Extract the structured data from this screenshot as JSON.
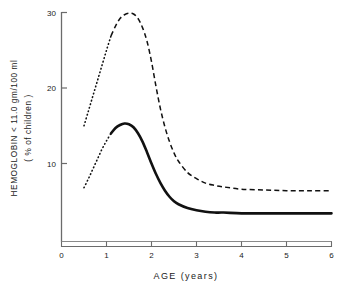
{
  "chart_data": {
    "type": "line",
    "title": "",
    "xlabel": "AGE  (years)",
    "ylabel_line1": "HEMOGLOBIN  < 11.0 gm/100 ml",
    "ylabel_line2": "( % of children )",
    "xlim": [
      0,
      6
    ],
    "ylim": [
      0,
      30
    ],
    "xticks": [
      0,
      1,
      2,
      3,
      4,
      5,
      6
    ],
    "xticklabels": [
      "0",
      "1",
      "2",
      "3",
      "4",
      "5",
      "6"
    ],
    "yticks": [
      10,
      20,
      30
    ],
    "yticklabels": [
      "10",
      "20",
      "30"
    ],
    "grid": false,
    "legend": "none",
    "series": [
      {
        "name": "upper-curve",
        "style": "dashed",
        "lead_in_style": "dotted",
        "x": [
          0.5,
          0.6,
          0.7,
          0.8,
          0.9,
          1.0,
          1.1,
          1.2,
          1.3,
          1.4,
          1.5,
          1.6,
          1.7,
          1.8,
          1.9,
          2.0,
          2.1,
          2.2,
          2.3,
          2.4,
          2.5,
          2.6,
          2.8,
          3.0,
          3.2,
          3.4,
          3.6,
          4.0,
          4.5,
          5.0,
          5.5,
          6.0
        ],
        "y": [
          15.0,
          17.0,
          19.0,
          21.0,
          23.0,
          25.0,
          26.9,
          28.2,
          29.2,
          29.7,
          29.9,
          29.8,
          29.2,
          28.0,
          26.2,
          23.5,
          20.2,
          17.2,
          14.8,
          12.9,
          11.4,
          10.3,
          8.8,
          8.0,
          7.4,
          7.1,
          6.9,
          6.6,
          6.5,
          6.4,
          6.4,
          6.4
        ],
        "lead_in_end_x": 1.1
      },
      {
        "name": "lower-curve",
        "style": "solid",
        "lead_in_style": "dotted",
        "x": [
          0.5,
          0.6,
          0.7,
          0.8,
          0.9,
          1.0,
          1.1,
          1.2,
          1.3,
          1.4,
          1.5,
          1.6,
          1.7,
          1.8,
          1.9,
          2.0,
          2.1,
          2.2,
          2.3,
          2.4,
          2.5,
          2.6,
          2.8,
          3.0,
          3.2,
          3.4,
          3.6,
          4.0,
          4.5,
          5.0,
          5.5,
          6.0
        ],
        "y": [
          6.8,
          8.0,
          9.3,
          10.6,
          11.9,
          13.0,
          14.0,
          14.7,
          15.1,
          15.3,
          15.2,
          14.8,
          14.0,
          12.9,
          11.5,
          10.0,
          8.6,
          7.4,
          6.4,
          5.6,
          5.0,
          4.6,
          4.1,
          3.8,
          3.6,
          3.5,
          3.5,
          3.4,
          3.4,
          3.4,
          3.4,
          3.4
        ],
        "lead_in_end_x": 1.1
      }
    ]
  },
  "colors": {
    "axis": "#6b6b6b",
    "curve": "#111111",
    "background": "#ffffff"
  }
}
